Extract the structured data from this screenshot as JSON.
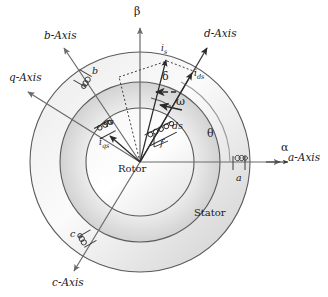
{
  "figure": {
    "type": "machine-cross-section-diagram",
    "width": 328,
    "height": 297,
    "background": "#ffffff",
    "line_color": "#555555",
    "text_color": "#1a1a1a",
    "shade_color": "#d9d9d9"
  },
  "geometry": {
    "center_x": 140,
    "center_y": 162,
    "outer_radius": 110,
    "mid_radius": 80,
    "inner_radius": 54,
    "rotor_radius": 54
  },
  "axes": [
    {
      "name": "alpha-axis",
      "label": "α",
      "kind": "greek",
      "angle_deg": 0,
      "x": 283,
      "y": 148
    },
    {
      "name": "beta-axis",
      "label": "β",
      "kind": "greek",
      "angle_deg": 90,
      "x": 135,
      "y": 12
    },
    {
      "name": "a-axis",
      "label": "a-Axis",
      "kind": "axis",
      "angle_deg": 0,
      "x": 290,
      "y": 158
    },
    {
      "name": "b-axis",
      "label": "b-Axis",
      "kind": "axis",
      "angle_deg": 120,
      "x": 46,
      "y": 36
    },
    {
      "name": "c-axis",
      "label": "c-Axis",
      "kind": "axis",
      "angle_deg": 240,
      "x": 55,
      "y": 283
    },
    {
      "name": "d-axis",
      "label": "d-Axis",
      "kind": "axis",
      "angle_deg": 63,
      "x": 206,
      "y": 34
    },
    {
      "name": "q-axis",
      "label": "q-Axis",
      "kind": "axis",
      "angle_deg": 153,
      "x": 12,
      "y": 78
    }
  ],
  "angles": [
    {
      "name": "theta",
      "label": "θ",
      "description": "rotor position angle from a-Axis to d-Axis",
      "x": 209,
      "y": 132
    },
    {
      "name": "delta",
      "label": "δ",
      "description": "angle between d-Axis and stator current vector",
      "x": 164,
      "y": 76
    },
    {
      "name": "omega",
      "label": "ω",
      "description": "rotor angular speed",
      "x": 178,
      "y": 101
    }
  ],
  "vectors": [
    {
      "name": "is",
      "label": "i",
      "sub": "s",
      "description": "stator current space vector",
      "x": 163,
      "y": 49
    },
    {
      "name": "ids",
      "label": "i",
      "sub": "ds",
      "description": "d-axis stator current component",
      "x": 196,
      "y": 75
    },
    {
      "name": "iqs",
      "label": "i",
      "sub": "qs",
      "description": "q-axis stator current component",
      "x": 102,
      "y": 143
    }
  ],
  "coils": [
    {
      "name": "coil-a",
      "label": "a",
      "x": 238,
      "y": 171,
      "description": "stator phase a winding"
    },
    {
      "name": "coil-b",
      "label": "b",
      "x": 92,
      "y": 71,
      "description": "stator phase b winding"
    },
    {
      "name": "coil-c",
      "label": "c",
      "x": 72,
      "y": 234,
      "description": "stator phase c winding"
    },
    {
      "name": "coil-ds",
      "label": "ds",
      "x": 174,
      "y": 125,
      "description": "rotor d-axis winding"
    },
    {
      "name": "coil-qs",
      "label": "qs",
      "x": 104,
      "y": 122,
      "description": "rotor q-axis winding"
    },
    {
      "name": "coil-f",
      "label": "f",
      "x": 162,
      "y": 141,
      "description": "field winding bracket label"
    }
  ],
  "regions": [
    {
      "name": "rotor-label",
      "label": "Rotor",
      "x": 121,
      "y": 168
    },
    {
      "name": "stator-label",
      "label": "Stator",
      "x": 196,
      "y": 213
    }
  ]
}
